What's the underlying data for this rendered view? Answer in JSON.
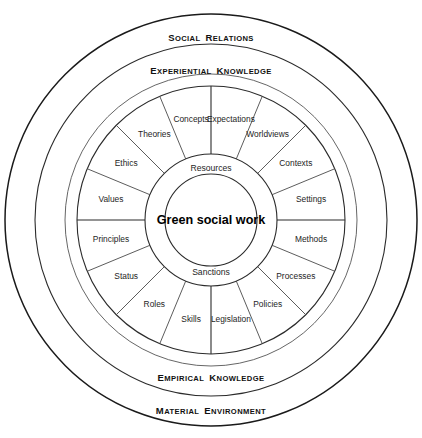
{
  "diagram": {
    "title": "Green social work",
    "type": "concentric-ring-wheel",
    "center": {
      "x": 211,
      "y": 220
    },
    "core": {
      "label": "Green social work",
      "radius": 46
    },
    "hub": {
      "radius": 66,
      "top_label": "Resources",
      "bottom_label": "Sanctions"
    },
    "wheel": {
      "inner_radius": 66,
      "outer_radius": 134,
      "segment_count": 16,
      "segment_degrees": 22.5,
      "segments": [
        {
          "index": 0,
          "label": "Values",
          "mid_angle_deg": -78.75
        },
        {
          "index": 1,
          "label": "Ethics",
          "mid_angle_deg": -56.25
        },
        {
          "index": 2,
          "label": "Theories",
          "mid_angle_deg": -33.75
        },
        {
          "index": 3,
          "label": "Concepts",
          "mid_angle_deg": -11.25
        },
        {
          "index": 4,
          "label": "Expectations",
          "mid_angle_deg": 11.25
        },
        {
          "index": 5,
          "label": "Worldviews",
          "mid_angle_deg": 33.75
        },
        {
          "index": 6,
          "label": "Contexts",
          "mid_angle_deg": 56.25
        },
        {
          "index": 7,
          "label": "Settings",
          "mid_angle_deg": 78.75
        },
        {
          "index": 8,
          "label": "Methods",
          "mid_angle_deg": 101.25
        },
        {
          "index": 9,
          "label": "Processes",
          "mid_angle_deg": 123.75
        },
        {
          "index": 10,
          "label": "Policies",
          "mid_angle_deg": 146.25
        },
        {
          "index": 11,
          "label": "Legislation",
          "mid_angle_deg": 168.75
        },
        {
          "index": 12,
          "label": "Skills",
          "mid_angle_deg": 191.25
        },
        {
          "index": 13,
          "label": "Roles",
          "mid_angle_deg": 213.75
        },
        {
          "index": 14,
          "label": "Status",
          "mid_angle_deg": 236.25
        },
        {
          "index": 15,
          "label": "Principles",
          "mid_angle_deg": 258.75
        }
      ]
    },
    "bands": [
      {
        "name": "experiential-knowledge",
        "radius": 146,
        "top_label": "Experiential Knowledge",
        "bottom_label": "Empirical Knowledge"
      },
      {
        "name": "social-relations",
        "radius": 176,
        "top_label": "Social Relations",
        "bottom_label": ""
      },
      {
        "name": "material-environment",
        "radius": 206,
        "top_label": "",
        "bottom_label": "Material Environment"
      }
    ],
    "band_labels": {
      "social_relations": "Social Relations",
      "experiential_knowledge": "Experiential Knowledge",
      "empirical_knowledge": "Empirical Knowledge",
      "material_environment": "Material Environment"
    },
    "colors": {
      "background": "#ffffff",
      "stroke_outer": "#1a1a1a",
      "stroke_ring": "#2b2b2b",
      "stroke_spoke": "#4a4a4a",
      "text": "#1e1e1e"
    }
  }
}
